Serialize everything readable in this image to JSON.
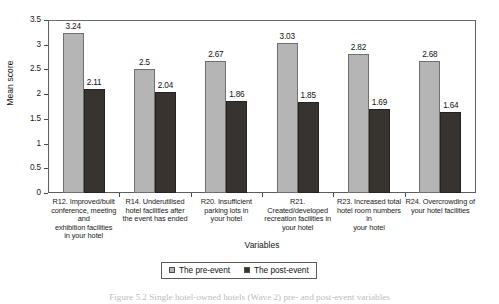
{
  "chart_data": {
    "type": "bar",
    "title": "",
    "xlabel": "Variables",
    "ylabel": "Mean score",
    "ylim": [
      0,
      3.5
    ],
    "yticks": [
      "0",
      "0.5",
      "1",
      "1.5",
      "2",
      "2.5",
      "3",
      "3.5"
    ],
    "ytick_values": [
      0,
      0.5,
      1,
      1.5,
      2,
      2.5,
      3,
      3.5
    ],
    "grid": false,
    "legend_position": "bottom-center",
    "categories": [
      "R12. Improved/built conference, meeting and exhibition facilities in your hotel",
      "R14. Underutilised hotel facilities after the event has ended",
      "R20. Insufficient parking lots in your hotel",
      "R21. Created/developed recreation facilities in your hotel",
      "R23. Increased total hotel room numbers in your hotel",
      "R24. Overcrowding of your hotel facilities"
    ],
    "category_lines": [
      [
        "R12. Improved/built",
        "conference, meeting and",
        "exhibition facilities",
        "in your hotel"
      ],
      [
        "R14. Underutilised",
        "hotel facilities after",
        "the event has ended"
      ],
      [
        "R20. Insufficient",
        "parking lots in",
        "your hotel"
      ],
      [
        "R21. Created/developed",
        "recreation facilities in",
        "your hotel"
      ],
      [
        "R23. Increased total",
        "hotel room numbers in",
        "your hotel"
      ],
      [
        "R24. Overcrowding of",
        "your hotel facilities"
      ]
    ],
    "series": [
      {
        "name": "The pre-event",
        "color": "#b5b5b5",
        "values": [
          3.24,
          2.5,
          2.67,
          3.03,
          2.82,
          2.68
        ],
        "labels": [
          "3.24",
          "2.5",
          "2.67",
          "3.03",
          "2.82",
          "2.68"
        ]
      },
      {
        "name": "The post-event",
        "color": "#38332e",
        "values": [
          2.11,
          2.04,
          1.86,
          1.85,
          1.69,
          1.64
        ],
        "labels": [
          "2.11",
          "2.04",
          "1.86",
          "1.85",
          "1.69",
          "1.64"
        ]
      }
    ]
  },
  "legend": {
    "items": [
      {
        "label": "The pre-event",
        "swatch": "pre"
      },
      {
        "label": "The post-event",
        "swatch": "post"
      }
    ]
  },
  "caption": {
    "text": "Figure 5.2  Single hotel-owned hotels (Wave 2) pre- and post-event variables"
  }
}
